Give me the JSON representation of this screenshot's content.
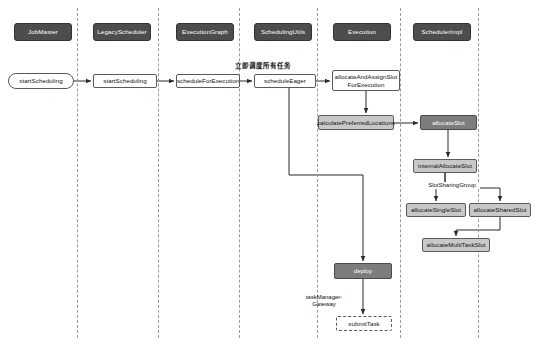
{
  "diagram": {
    "type": "uml-sequence-diagram",
    "title": "",
    "colors": {
      "actor_fill": "#4d4d4d",
      "actor_text": "#ffffff",
      "light_gray_fill": "#c8c8c8",
      "dark_gray_fill": "#7d7d7d",
      "white_fill": "#ffffff",
      "stroke": "#5a5a5a",
      "lifeline": "#9a9a9a",
      "background": "#ffffff"
    },
    "lanes": [
      {
        "id": "jobmaster",
        "label": "JobMaster",
        "x": 14,
        "y": 23,
        "w": 58,
        "h": 18,
        "lifeline_x": 77
      },
      {
        "id": "legacyscheduler",
        "label": "LegacyScheduler",
        "x": 93,
        "y": 23,
        "w": 58,
        "h": 18,
        "lifeline_x": 158
      },
      {
        "id": "executiongraph",
        "label": "ExecutionGraph",
        "x": 176,
        "y": 23,
        "w": 58,
        "h": 18,
        "lifeline_x": 239
      },
      {
        "id": "schedulingutils",
        "label": "SchedulingUtils",
        "x": 254,
        "y": 23,
        "w": 58,
        "h": 18,
        "lifeline_x": 317
      },
      {
        "id": "execution",
        "label": "Execution",
        "x": 333,
        "y": 23,
        "w": 58,
        "h": 18,
        "lifeline_x": 400
      },
      {
        "id": "schedulerimpl",
        "label": "SchedulerImpl",
        "x": 413,
        "y": 23,
        "w": 58,
        "h": 18,
        "lifeline_x": 478
      }
    ],
    "nodes": [
      {
        "id": "start-scheduling-entry",
        "label": "startScheduling",
        "style": "rounded",
        "x": 8,
        "y": 73,
        "w": 66,
        "h": 16
      },
      {
        "id": "start-scheduling-call",
        "label": "startScheduling",
        "style": "white",
        "x": 93,
        "y": 74,
        "w": 64,
        "h": 14
      },
      {
        "id": "schedule-for-execution",
        "label": "scheduleForExecution",
        "style": "white",
        "x": 176,
        "y": 74,
        "w": 64,
        "h": 14
      },
      {
        "id": "schedule-eager",
        "label": "scheduleEager",
        "style": "white",
        "x": 254,
        "y": 74,
        "w": 62,
        "h": 14
      },
      {
        "id": "allocate-and-assign-slot-for-execution",
        "label": "allocateAndAssignSlot\nForExecution",
        "style": "white",
        "x": 332,
        "y": 70,
        "w": 68,
        "h": 21
      },
      {
        "id": "calculate-preferred-locations",
        "label": "calculatePreferredLocations",
        "style": "lightgray",
        "x": 318,
        "y": 115,
        "w": 76,
        "h": 15
      },
      {
        "id": "allocate-slot",
        "label": "allocateSlot",
        "style": "darkgray",
        "x": 420,
        "y": 115,
        "w": 57,
        "h": 15
      },
      {
        "id": "internal-allocate-slot",
        "label": "internalAllocateSlot",
        "style": "lightgray",
        "x": 413,
        "y": 159,
        "w": 64,
        "h": 14
      },
      {
        "id": "allocate-single-slot",
        "label": "allocateSingleSlot",
        "style": "lightgray",
        "x": 406,
        "y": 203,
        "w": 60,
        "h": 14
      },
      {
        "id": "allocate-shared-slot",
        "label": "allocateSharedSlot",
        "style": "lightgray",
        "x": 469,
        "y": 203,
        "w": 62,
        "h": 14
      },
      {
        "id": "allocate-multi-task-slot",
        "label": "allocateMultiTaskSlot",
        "style": "lightgray",
        "x": 422,
        "y": 238,
        "w": 68,
        "h": 14
      },
      {
        "id": "deploy",
        "label": "deploy",
        "style": "darkgray",
        "x": 334,
        "y": 263,
        "w": 58,
        "h": 16
      },
      {
        "id": "submit-task",
        "label": "submitTask",
        "style": "dashed",
        "x": 336,
        "y": 316,
        "w": 56,
        "h": 15
      }
    ],
    "annotations": [
      {
        "id": "schedule-all-tasks-immediately",
        "text": "立即调度所有任务",
        "x": 218,
        "y": 60,
        "w": 90,
        "bold": true
      },
      {
        "id": "slot-sharing-group",
        "text": "SlotSharingGroup",
        "x": 424,
        "y": 182,
        "w": 56,
        "bold": false
      },
      {
        "id": "task-manager-gateway",
        "text": "taskManager-\nGateway",
        "x": 296,
        "y": 294,
        "w": 56,
        "bold": false
      }
    ]
  }
}
